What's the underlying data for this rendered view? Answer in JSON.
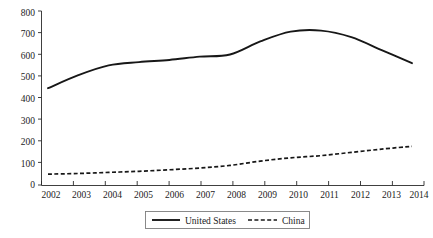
{
  "chart_data": {
    "type": "line",
    "title": "",
    "subtitle": "",
    "xlabel": "",
    "ylabel": "",
    "categories": [
      "2002",
      "2003",
      "2004",
      "2005",
      "2006",
      "2007",
      "2008",
      "2009",
      "2010",
      "2011",
      "2012",
      "2013",
      "2014"
    ],
    "x": [
      2002,
      2003,
      2004,
      2005,
      2006,
      2007,
      2008,
      2009,
      2010,
      2011,
      2012,
      2013,
      2014
    ],
    "series": [
      {
        "name": "United States",
        "style": "solid",
        "color": "#171717",
        "values": [
          445,
          505,
          550,
          565,
          575,
          590,
          600,
          660,
          705,
          710,
          680,
          620,
          560
        ]
      },
      {
        "name": "China",
        "style": "dashed",
        "color": "#171717",
        "values": [
          50,
          53,
          58,
          63,
          70,
          78,
          90,
          110,
          125,
          135,
          150,
          165,
          178
        ]
      }
    ],
    "ylim": [
      0,
      800
    ],
    "xlim": [
      2002,
      2014
    ],
    "yticks": [
      0,
      100,
      200,
      300,
      400,
      500,
      600,
      700,
      800
    ],
    "ytick_labels": [
      "0",
      "100",
      "200",
      "300",
      "400",
      "500",
      "600",
      "700",
      "800"
    ],
    "xtick_labels": [
      "2002",
      "2003",
      "2004",
      "2005",
      "2006",
      "2007",
      "2008",
      "2009",
      "2010",
      "2011",
      "2012",
      "2013",
      "2014"
    ],
    "grid": false,
    "legend_position": "bottom-center",
    "legend_entries": [
      "United States",
      "China"
    ]
  },
  "legend": {
    "entries": [
      {
        "label": "United States"
      },
      {
        "label": "China"
      }
    ]
  },
  "axes": {
    "y_labels": [
      "800",
      "700",
      "600",
      "500",
      "400",
      "300",
      "200",
      "100",
      "0"
    ],
    "x_labels": [
      "2002",
      "2003",
      "2004",
      "2005",
      "2006",
      "2007",
      "2008",
      "2009",
      "2010",
      "2011",
      "2012",
      "2013",
      "2014"
    ]
  }
}
